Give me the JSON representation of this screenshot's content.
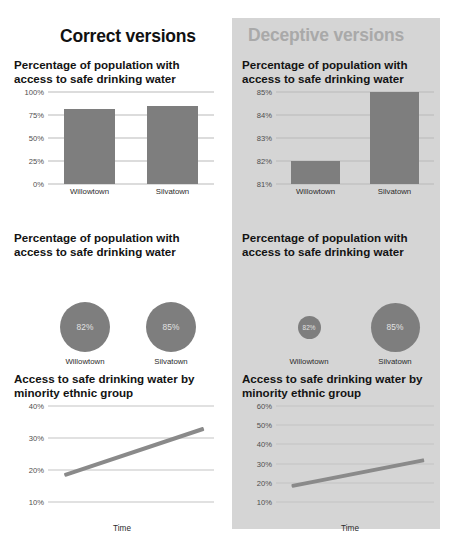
{
  "headings": {
    "correct": "Correct versions",
    "deceptive": "Deceptive versions"
  },
  "labels": {
    "town_a": "Willowtown",
    "town_b": "Silvatown",
    "time_axis": "Time"
  },
  "colors": {
    "bar": "#7e7e7e",
    "panel_grey": "#d5d5d5",
    "deceptive_heading": "#a9a9a9",
    "gridline": "#b9b9b9",
    "line": "#8a8a8a"
  },
  "chart_data": [
    {
      "id": "bar-correct",
      "type": "bar",
      "title": "Percentage of population with access to safe drinking water",
      "categories": [
        "Willowtown",
        "Silvatown"
      ],
      "values": [
        82,
        85
      ],
      "ticks": [
        "0%",
        "25%",
        "50%",
        "75%",
        "100%"
      ],
      "tick_values": [
        0,
        25,
        50,
        75,
        100
      ],
      "ylim": [
        0,
        100
      ],
      "xlabel": "",
      "ylabel": "",
      "grid": true,
      "variant": "correct"
    },
    {
      "id": "bar-deceptive",
      "type": "bar",
      "title": "Percentage of population with access to safe drinking water",
      "categories": [
        "Willowtown",
        "Silvatown"
      ],
      "values": [
        82,
        85
      ],
      "ticks": [
        "81%",
        "82%",
        "83%",
        "84%",
        "85%"
      ],
      "tick_values": [
        81,
        82,
        83,
        84,
        85
      ],
      "ylim": [
        81,
        85
      ],
      "xlabel": "",
      "ylabel": "",
      "grid": true,
      "variant": "deceptive"
    },
    {
      "id": "bubble-correct",
      "type": "pie",
      "title": "Percentage of population with access to safe drinking water",
      "categories": [
        "Willowtown",
        "Silvatown"
      ],
      "values": [
        82,
        85
      ],
      "value_labels": [
        "82%",
        "85%"
      ],
      "encoding": "area-proportional-to-value",
      "diameters_px": [
        50,
        50
      ],
      "variant": "correct"
    },
    {
      "id": "bubble-deceptive",
      "type": "pie",
      "title": "Percentage of population with access to safe drinking water",
      "categories": [
        "Willowtown",
        "Silvatown"
      ],
      "values": [
        82,
        85
      ],
      "value_labels": [
        "82%",
        "85%"
      ],
      "encoding": "exaggerated-area",
      "diameters_px": [
        23,
        49
      ],
      "variant": "deceptive"
    },
    {
      "id": "line-correct",
      "type": "line",
      "title": "Access to safe drinking water by minority ethnic group",
      "x": [
        "start",
        "end"
      ],
      "values": [
        18.5,
        33
      ],
      "ticks": [
        "10%",
        "20%",
        "30%",
        "40%"
      ],
      "tick_values": [
        10,
        20,
        30,
        40
      ],
      "ylim": [
        10,
        40
      ],
      "xlabel": "Time",
      "ylabel": "",
      "grid": true,
      "variant": "correct"
    },
    {
      "id": "line-deceptive",
      "type": "line",
      "title": "Access to safe drinking water by minority ethnic group",
      "x": [
        "start",
        "end"
      ],
      "values": [
        18.5,
        32
      ],
      "ticks": [
        "10%",
        "20%",
        "30%",
        "40%",
        "50%",
        "60%"
      ],
      "tick_values": [
        10,
        20,
        30,
        40,
        50,
        60
      ],
      "ylim": [
        10,
        60
      ],
      "xlabel": "Time",
      "ylabel": "",
      "grid": true,
      "variant": "deceptive"
    }
  ]
}
